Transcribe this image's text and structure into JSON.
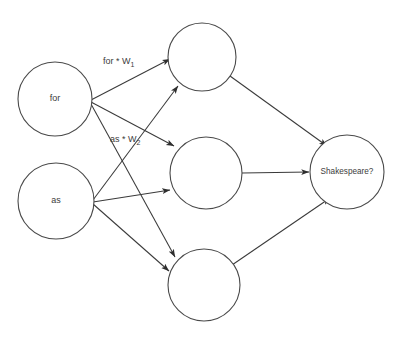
{
  "diagram": {
    "type": "neural-network",
    "background_color": "#ffffff",
    "stroke_color": "#3a3a3a",
    "text_color": "#3c3c3c",
    "layers": {
      "input": {
        "name": "input-layer",
        "nodes": [
          {
            "id": "in-for",
            "label": "for",
            "cx": 55,
            "cy": 99,
            "r": 37
          },
          {
            "id": "in-as",
            "label": "as",
            "cx": 56,
            "cy": 201,
            "r": 38
          }
        ]
      },
      "hidden": {
        "name": "hidden-layer",
        "nodes": [
          {
            "id": "hid-1",
            "label": "",
            "cx": 202,
            "cy": 57,
            "r": 34
          },
          {
            "id": "hid-2",
            "label": "",
            "cx": 206,
            "cy": 173,
            "r": 36
          },
          {
            "id": "hid-3",
            "label": "",
            "cx": 204,
            "cy": 285,
            "r": 36
          }
        ]
      },
      "output": {
        "name": "output-layer",
        "nodes": [
          {
            "id": "out-1",
            "label": "Shakespeare?",
            "cx": 347,
            "cy": 172,
            "r": 37
          }
        ]
      }
    },
    "edge_labels": [
      {
        "id": "label-w1",
        "base": "for * W",
        "subscript": "1",
        "x": 103,
        "y": 62,
        "describes": "edge from input 'for' to first hidden node"
      },
      {
        "id": "label-w2",
        "base": "as * W",
        "subscript": "2",
        "x": 110,
        "y": 140,
        "describes": "edge from input 'as' to second hidden node"
      }
    ],
    "edges": [
      {
        "id": "edge-for-h1",
        "from": "in-for",
        "to": "hid-1",
        "x1": 91,
        "y1": 100,
        "x2": 170,
        "y2": 59
      },
      {
        "id": "edge-for-h2",
        "from": "in-for",
        "to": "hid-2",
        "x1": 91,
        "y1": 102,
        "x2": 174,
        "y2": 146
      },
      {
        "id": "edge-for-h3",
        "from": "in-for",
        "to": "hid-3",
        "x1": 91,
        "y1": 104,
        "x2": 175,
        "y2": 257
      },
      {
        "id": "edge-as-h1",
        "from": "in-as",
        "to": "hid-1",
        "x1": 93,
        "y1": 200,
        "x2": 178,
        "y2": 86
      },
      {
        "id": "edge-as-h2",
        "from": "in-as",
        "to": "hid-2",
        "x1": 93,
        "y1": 202,
        "x2": 170,
        "y2": 190
      },
      {
        "id": "edge-as-h3",
        "from": "in-as",
        "to": "hid-3",
        "x1": 93,
        "y1": 204,
        "x2": 169,
        "y2": 271
      },
      {
        "id": "edge-h1-out",
        "from": "hid-1",
        "to": "out-1",
        "x1": 230,
        "y1": 76,
        "x2": 327,
        "y2": 146
      },
      {
        "id": "edge-h2-out",
        "from": "hid-2",
        "to": "out-1",
        "x1": 242,
        "y1": 173,
        "x2": 309,
        "y2": 172
      },
      {
        "id": "edge-h3-out",
        "from": "hid-3",
        "to": "out-1",
        "x1": 232,
        "y1": 265,
        "x2": 330,
        "y2": 198
      }
    ]
  }
}
